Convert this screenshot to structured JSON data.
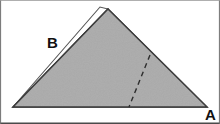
{
  "figure": {
    "canvas": {
      "width": 220,
      "height": 124
    },
    "background_color": "#ffffff",
    "border_color": "#4a4a4a",
    "labels": {
      "a": "A",
      "b": "B"
    },
    "label_positions": {
      "a": {
        "x": 205,
        "y": 107
      },
      "b": {
        "x": 47,
        "y": 35
      }
    },
    "shapes": {
      "filled_triangle": {
        "name": "gray-triangle",
        "fill_color": "#ababab",
        "stroke_color": "#3d3d3d",
        "stroke_width": 1.4,
        "points": [
          {
            "x": 108,
            "y": 9
          },
          {
            "x": 207,
            "y": 107
          },
          {
            "x": 13,
            "y": 107
          }
        ]
      },
      "outline_triangle": {
        "name": "white-outline-triangle",
        "fill_color": "#ffffff",
        "stroke_color": "#555555",
        "stroke_width": 1.1,
        "points": [
          {
            "x": 100,
            "y": 7
          },
          {
            "x": 13,
            "y": 107
          },
          {
            "x": 108,
            "y": 9
          }
        ]
      },
      "fold_line": {
        "name": "dashed-fold-line",
        "stroke_color": "#2e2e2e",
        "stroke_width": 1.4,
        "dash_pattern": "5 4",
        "start": {
          "x": 150,
          "y": 55
        },
        "end": {
          "x": 129,
          "y": 107
        }
      }
    }
  }
}
